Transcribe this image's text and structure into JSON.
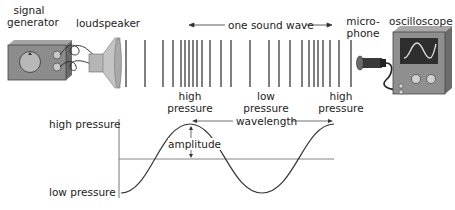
{
  "labels": {
    "signal_generator": [
      "signal",
      "generator"
    ],
    "loudspeaker": "loudspeaker",
    "one_sound_wave": "one sound wave",
    "microphone": [
      "micro-",
      "phone"
    ],
    "oscilloscope": "oscilloscope",
    "high_pressure_left": [
      "high",
      "pressure"
    ],
    "low_pressure_mid": [
      "low",
      "pressure"
    ],
    "high_pressure_right": [
      "high",
      "pressure"
    ],
    "wavelength": "wavelength",
    "amplitude": "amplitude",
    "graph_high": "high pressure",
    "graph_low": "low pressure"
  },
  "colors": {
    "device_body": "#8a8a8a",
    "device_dark": "#555555",
    "screen": "#2f2f2f",
    "trace": "#d9d9d9",
    "line": "#333333",
    "axis": "#777777"
  },
  "wavefront_lines_x": [
    126,
    145,
    163,
    173,
    181,
    185,
    189,
    193,
    197,
    202,
    210,
    221,
    231,
    250,
    269,
    279,
    290,
    302,
    309,
    314,
    318,
    323,
    330,
    339,
    351
  ]
}
